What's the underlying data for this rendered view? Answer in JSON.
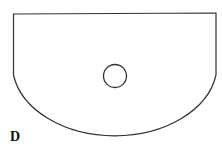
{
  "figure": {
    "label": "D",
    "shape": "rectangle-with-semi-elliptical-bottom",
    "stroke_color": "#333333",
    "fill_color": "#ffffff",
    "hole": "circle"
  }
}
